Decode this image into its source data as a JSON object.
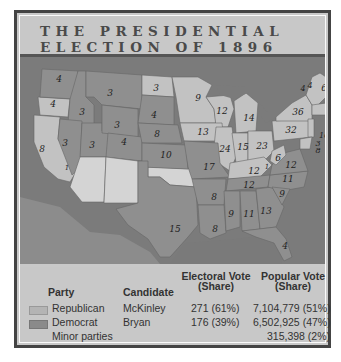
{
  "title": {
    "line1": "THE PRESIDENTIAL",
    "line2": "ELECTION OF 1896"
  },
  "colors": {
    "republican": "#b4b4b4",
    "democrat": "#8a8a8a",
    "non_voting": "#d4d4d4",
    "water": "#7a7a7a",
    "frame": "#444444",
    "background": "#c8c8c8"
  },
  "legend": {
    "non_voting_label": "Non-voting territory"
  },
  "state_labels": [
    {
      "state": "Washington",
      "votes": "4",
      "x": 39,
      "y": 22,
      "party": "democrat"
    },
    {
      "state": "Oregon",
      "votes": "4",
      "x": 33,
      "y": 47,
      "party": "republican"
    },
    {
      "state": "California",
      "votes": "8",
      "x": 22,
      "y": 102,
      "party": "republican"
    },
    {
      "state": "California-split",
      "votes": "1",
      "x": 44,
      "y": 115,
      "party": "democrat"
    },
    {
      "state": "Idaho",
      "votes": "3",
      "x": 62,
      "y": 55,
      "party": "democrat"
    },
    {
      "state": "Nevada",
      "votes": "3",
      "x": 45,
      "y": 86,
      "party": "democrat"
    },
    {
      "state": "Montana",
      "votes": "3",
      "x": 90,
      "y": 36,
      "party": "democrat"
    },
    {
      "state": "Wyoming",
      "votes": "3",
      "x": 96,
      "y": 67,
      "party": "democrat"
    },
    {
      "state": "Utah",
      "votes": "3",
      "x": 71,
      "y": 89,
      "party": "democrat"
    },
    {
      "state": "Colorado",
      "votes": "4",
      "x": 104,
      "y": 85,
      "party": "democrat"
    },
    {
      "state": "North Dakota",
      "votes": "3",
      "x": 136,
      "y": 31,
      "party": "republican"
    },
    {
      "state": "South Dakota",
      "votes": "4",
      "x": 134,
      "y": 58,
      "party": "democrat"
    },
    {
      "state": "Nebraska",
      "votes": "8",
      "x": 137,
      "y": 80,
      "party": "democrat"
    },
    {
      "state": "Kansas",
      "votes": "10",
      "x": 147,
      "y": 102,
      "party": "democrat"
    },
    {
      "state": "Minnesota",
      "votes": "9",
      "x": 178,
      "y": 41,
      "party": "republican"
    },
    {
      "state": "Wisconsin",
      "votes": "12",
      "x": 202,
      "y": 55,
      "party": "republican"
    },
    {
      "state": "Michigan",
      "votes": "14",
      "x": 228,
      "y": 61,
      "party": "republican"
    },
    {
      "state": "Iowa",
      "votes": "13",
      "x": 183,
      "y": 75,
      "party": "republican"
    },
    {
      "state": "Illinois",
      "votes": "24",
      "x": 205,
      "y": 97,
      "party": "republican"
    },
    {
      "state": "Indiana",
      "votes": "15",
      "x": 224,
      "y": 95,
      "party": "republican"
    },
    {
      "state": "Ohio",
      "votes": "23",
      "x": 244,
      "y": 94,
      "party": "republican"
    },
    {
      "state": "Pennsylvania",
      "votes": "32",
      "x": 268,
      "y": 72,
      "party": "republican"
    },
    {
      "state": "New York",
      "votes": "36",
      "x": 278,
      "y": 56,
      "party": "republican"
    },
    {
      "state": "Vermont",
      "votes": "4",
      "x": 283,
      "y": 30,
      "party": "republican"
    },
    {
      "state": "New Hampshire",
      "votes": "4",
      "x": 289,
      "y": 27,
      "party": "republican"
    },
    {
      "state": "Maine",
      "votes": "6",
      "x": 304,
      "y": 30,
      "party": "republican"
    },
    {
      "state": "Massachusetts",
      "votes": "15",
      "x": 315,
      "y": 56,
      "party": "republican"
    },
    {
      "state": "Rhode Island",
      "votes": "4",
      "x": 311,
      "y": 63,
      "party": "republican"
    },
    {
      "state": "Connecticut",
      "votes": "6",
      "x": 311,
      "y": 70,
      "party": "republican"
    },
    {
      "state": "New Jersey",
      "votes": "10",
      "x": 302,
      "y": 76,
      "party": "republican"
    },
    {
      "state": "Delaware",
      "votes": "3",
      "x": 298,
      "y": 84,
      "party": "republican"
    },
    {
      "state": "Maryland",
      "votes": "8",
      "x": 298,
      "y": 91,
      "party": "republican"
    },
    {
      "state": "West Virginia",
      "votes": "6",
      "x": 258,
      "y": 102,
      "party": "republican"
    },
    {
      "state": "Virginia",
      "votes": "12",
      "x": 269,
      "y": 109,
      "party": "democrat"
    },
    {
      "state": "Kentucky",
      "votes": "12",
      "x": 233,
      "y": 115,
      "party": "republican"
    },
    {
      "state": "Kentucky-split",
      "votes": "1",
      "x": 247,
      "y": 110,
      "party": "democrat"
    },
    {
      "state": "Missouri",
      "votes": "17",
      "x": 192,
      "y": 113,
      "party": "democrat"
    },
    {
      "state": "Tennessee",
      "votes": "12",
      "x": 227,
      "y": 132,
      "party": "democrat"
    },
    {
      "state": "North Carolina",
      "votes": "11",
      "x": 267,
      "y": 124,
      "party": "democrat"
    },
    {
      "state": "South Carolina",
      "votes": "9",
      "x": 261,
      "y": 137,
      "party": "democrat"
    },
    {
      "state": "Georgia",
      "votes": "13",
      "x": 246,
      "y": 155,
      "party": "democrat"
    },
    {
      "state": "Alabama",
      "votes": "11",
      "x": 227,
      "y": 158,
      "party": "democrat"
    },
    {
      "state": "Mississippi",
      "votes": "9",
      "x": 209,
      "y": 160,
      "party": "democrat"
    },
    {
      "state": "Louisiana",
      "votes": "8",
      "x": 193,
      "y": 172,
      "party": "democrat"
    },
    {
      "state": "Arkansas",
      "votes": "8",
      "x": 193,
      "y": 142,
      "party": "democrat"
    },
    {
      "state": "Texas",
      "votes": "15",
      "x": 152,
      "y": 168,
      "party": "democrat"
    },
    {
      "state": "Florida",
      "votes": "4",
      "x": 265,
      "y": 189,
      "party": "democrat"
    }
  ],
  "table": {
    "headers": {
      "party": "Party",
      "candidate": "Candidate",
      "electoral_line1": "Electoral Vote",
      "electoral_line2": "(Share)",
      "popular_line1": "Popular Vote",
      "popular_line2": "(Share)"
    },
    "rows": [
      {
        "party": "Republican",
        "candidate": "McKinley",
        "electoral": "271 (61%)",
        "popular": "7,104,779 (51%)",
        "swatch": "republican"
      },
      {
        "party": "Democrat",
        "candidate": "Bryan",
        "electoral": "176 (39%)",
        "popular": "6,502,925 (47%)",
        "swatch": "democrat"
      },
      {
        "party": "Minor parties",
        "candidate": "",
        "electoral": "",
        "popular": "315,398 (2%)",
        "swatch": ""
      }
    ]
  }
}
